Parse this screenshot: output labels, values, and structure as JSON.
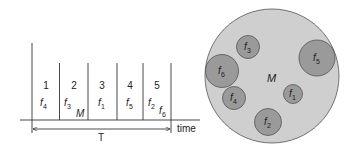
{
  "timeline": {
    "slots": [
      {
        "number": "1",
        "frequency": "f",
        "sub": "4"
      },
      {
        "number": "2",
        "frequency": "f",
        "sub": "3"
      },
      {
        "number": "3",
        "frequency": "f",
        "sub": "1"
      },
      {
        "number": "4",
        "frequency": "f",
        "sub": "5"
      },
      {
        "number": "5",
        "frequency": "f",
        "sub": "2"
      }
    ],
    "extra_label": {
      "frequency": "f",
      "sub": "6"
    },
    "marker_label": "M",
    "period_label": "T",
    "axis_label": "time"
  },
  "circle": {
    "label": "M",
    "fill": "#cfcfcf",
    "inner_fill": "#9a9a9a",
    "items": [
      {
        "frequency": "f",
        "sub": "3"
      },
      {
        "frequency": "f",
        "sub": "5"
      },
      {
        "frequency": "f",
        "sub": "6"
      },
      {
        "frequency": "f",
        "sub": "4"
      },
      {
        "frequency": "f",
        "sub": "1"
      },
      {
        "frequency": "f",
        "sub": "2"
      }
    ]
  }
}
